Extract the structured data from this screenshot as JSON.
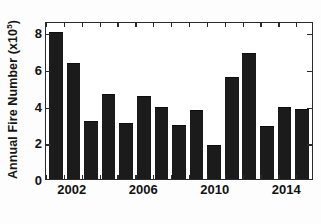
{
  "chart_data": {
    "type": "bar",
    "title": "",
    "subtitle": "",
    "xlabel": "",
    "ylabel": "Annual Fire Number (x10⁵)",
    "ylabel_base": "Annual Fire Number (x10",
    "ylabel_exponent": "5",
    "ylabel_suffix": ")",
    "categories": [
      "2001",
      "2002",
      "2003",
      "2004",
      "2005",
      "2006",
      "2007",
      "2008",
      "2009",
      "2010",
      "2011",
      "2012",
      "2013",
      "2014",
      "2015"
    ],
    "values": [
      8.1,
      6.4,
      3.2,
      4.7,
      3.1,
      4.55,
      3.95,
      3.0,
      3.8,
      1.85,
      5.6,
      6.95,
      2.95,
      3.95,
      3.85
    ],
    "value_units": "x10^5 fires",
    "ylim": [
      0,
      8.6
    ],
    "xlim_labels": [
      "2002",
      "2006",
      "2010",
      "2014"
    ],
    "ytick_values": [
      0,
      2,
      4,
      6,
      8
    ],
    "ytick_labels": [
      "0",
      "2",
      "4",
      "6",
      "8"
    ],
    "xtick_labels": [
      {
        "label": "2002",
        "category": "2002"
      },
      {
        "label": "2006",
        "category": "2006"
      },
      {
        "label": "2010",
        "category": "2010"
      },
      {
        "label": "2014",
        "category": "2014"
      }
    ],
    "grid": false,
    "legend": null,
    "legend_position": "none",
    "bar_color": "#1b1b1b",
    "axis_color": "#2a2a2a",
    "background_color": "#ffffff",
    "annotations": []
  }
}
